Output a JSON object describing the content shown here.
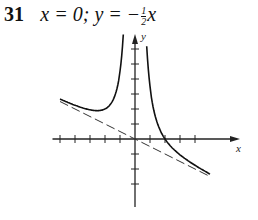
{
  "problem": {
    "number": "31",
    "text_prefix": "x = 0; y = −",
    "frac_num": "1",
    "frac_den": "2",
    "text_suffix": "x"
  },
  "chart_data": {
    "type": "line",
    "xlabel": "x",
    "ylabel": "y",
    "grid": false,
    "xlim": [
      -5.5,
      6.7
    ],
    "ylim": [
      -4.4,
      7.5
    ],
    "x_ticks": [
      -5,
      -4,
      -3,
      -2,
      -1,
      1,
      2,
      3,
      4
    ],
    "y_ticks": [
      -3,
      -2,
      -1,
      1,
      2,
      3,
      4,
      5,
      6
    ],
    "series": [
      {
        "name": "curve",
        "function": "y = 4/x^2 - x/2",
        "style": "solid",
        "x": [
          -5,
          -4,
          -3,
          -2.5,
          -2,
          -1.5,
          -1,
          -0.8,
          0.9,
          1,
          1.5,
          2,
          3,
          4,
          5
        ],
        "y": [
          2.66,
          2.25,
          1.94,
          1.89,
          2.0,
          2.53,
          4.5,
          6.65,
          4.49,
          3.5,
          1.03,
          0,
          -1.06,
          -1.75,
          -2.34
        ]
      },
      {
        "name": "asymptote y = -x/2",
        "style": "dashed",
        "x": [
          -5,
          5
        ],
        "y": [
          2.5,
          -2.5
        ]
      },
      {
        "name": "asymptote x = 0",
        "style": "axis",
        "x": [
          0,
          0
        ],
        "y": [
          -4.4,
          7.5
        ]
      }
    ],
    "asymptotes": [
      "x = 0",
      "y = -1/2 x"
    ]
  }
}
